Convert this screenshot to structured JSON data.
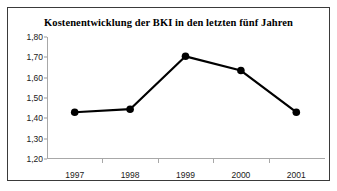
{
  "chart_data": {
    "type": "line",
    "title": "Kostenentwicklung der BKI in den letzten fünf Jahren",
    "categories": [
      "1997",
      "1998",
      "1999",
      "2000",
      "2001"
    ],
    "values": [
      1.43,
      1.445,
      1.705,
      1.635,
      1.43
    ],
    "value_labels": [
      "1,43",
      "1,45",
      "1,71",
      "1,64",
      "1,43"
    ],
    "xlabel": "",
    "ylabel": "",
    "ylim": [
      1.2,
      1.8
    ],
    "ytick_step": 0.1,
    "ytick_labels": [
      "1,80",
      "1,70",
      "1,60",
      "1,50",
      "1,40",
      "1,30",
      "1,20"
    ],
    "ytick_values": [
      1.8,
      1.7,
      1.6,
      1.5,
      1.4,
      1.3,
      1.2
    ],
    "grid": false,
    "legend": false,
    "legend_position": "none",
    "series_color": "#000000",
    "marker": "circle",
    "marker_color": "#000000",
    "axis_color": "#a8a8a8",
    "frame_color": "#3a3a3a",
    "background_color": "#ffffff"
  }
}
